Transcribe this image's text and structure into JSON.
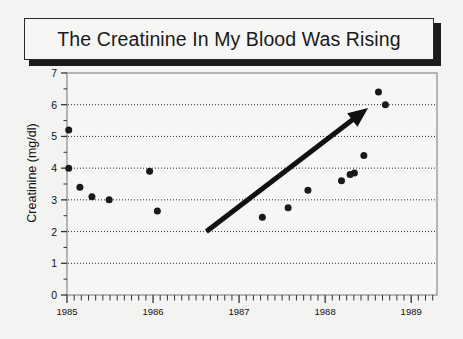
{
  "slide": {
    "title": "The Creatinine In My Blood Was Rising",
    "background_color": "#f3f3f1",
    "title_border_color": "#2a2a2a",
    "title_shadow_color": "#1b1b1b"
  },
  "chart_data": {
    "type": "scatter",
    "title": "The Creatinine In My Blood Was Rising",
    "xlabel": "",
    "ylabel": "Creatinine (mg/dl)",
    "xlim": [
      1985.0,
      1989.3
    ],
    "ylim": [
      0,
      7
    ],
    "yticks": [
      0,
      1,
      2,
      3,
      4,
      5,
      6,
      7
    ],
    "ytick_labels": [
      "0",
      "1",
      "2",
      "3",
      "4",
      "5",
      "6",
      "7"
    ],
    "xticks": [
      1985,
      1986,
      1987,
      1988,
      1989
    ],
    "xtick_labels": [
      "1985",
      "1986",
      "1987",
      "1988",
      "1989"
    ],
    "minor_xticks_per_year": 12,
    "grid": "horizontal-dotted",
    "gridlines_at": [
      1,
      2,
      3,
      4,
      5,
      6
    ],
    "legend": "none",
    "marker": {
      "shape": "circle",
      "color": "#1a1a1a",
      "size_px": 7
    },
    "points": [
      {
        "x": 1985.02,
        "y": 5.2
      },
      {
        "x": 1985.02,
        "y": 4.0
      },
      {
        "x": 1985.15,
        "y": 3.4
      },
      {
        "x": 1985.29,
        "y": 3.1
      },
      {
        "x": 1985.49,
        "y": 3.0
      },
      {
        "x": 1985.96,
        "y": 3.9
      },
      {
        "x": 1986.05,
        "y": 2.65
      },
      {
        "x": 1987.27,
        "y": 2.45
      },
      {
        "x": 1987.57,
        "y": 2.75
      },
      {
        "x": 1987.8,
        "y": 3.3
      },
      {
        "x": 1988.19,
        "y": 3.6
      },
      {
        "x": 1988.29,
        "y": 3.8
      },
      {
        "x": 1988.34,
        "y": 3.85
      },
      {
        "x": 1988.45,
        "y": 4.4
      },
      {
        "x": 1988.62,
        "y": 6.4
      },
      {
        "x": 1988.7,
        "y": 6.0
      }
    ],
    "annotations": [
      {
        "type": "arrow",
        "label": "rising-trend-arrow",
        "from": {
          "x": 1986.62,
          "y": 2.0
        },
        "to": {
          "x": 1988.5,
          "y": 5.9
        },
        "color": "#111111",
        "width_px": 5
      }
    ]
  }
}
